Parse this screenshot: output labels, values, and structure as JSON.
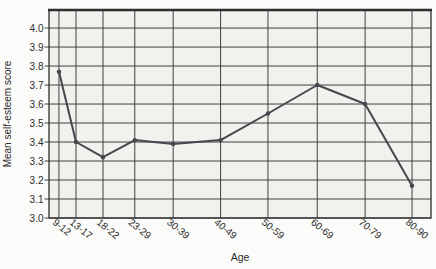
{
  "figure": {
    "background": "#fbfbf9",
    "plot_background": "#f1f1ee",
    "grid_color": "#414141",
    "frame_color": "#2e2e2e",
    "line_color": "#46464d",
    "text_color": "#2b2b2b"
  },
  "chart_data": {
    "type": "line",
    "xlabel": "Age",
    "ylabel": "Mean self-esteem score",
    "categories": [
      "9-12",
      "13-17",
      "18-22",
      "23-29",
      "30-39",
      "40-49",
      "50-59",
      "60-69",
      "70-79",
      "80-90"
    ],
    "x_age_positions": [
      10.5,
      14.1,
      19.8,
      26.5,
      34.6,
      44.6,
      54.6,
      65.0,
      75.1,
      85.0
    ],
    "values": [
      3.77,
      3.4,
      3.32,
      3.41,
      3.39,
      3.41,
      3.55,
      3.7,
      3.6,
      3.17
    ],
    "yticks": [
      3.0,
      3.1,
      3.2,
      3.3,
      3.4,
      3.5,
      3.6,
      3.7,
      3.8,
      3.9,
      4.0
    ],
    "xlim": [
      8.4,
      89.0
    ],
    "ylim": [
      3.0,
      4.095
    ],
    "grid": "both",
    "marker": "dot",
    "legend": "none",
    "xtick_rotation_deg": 39
  }
}
